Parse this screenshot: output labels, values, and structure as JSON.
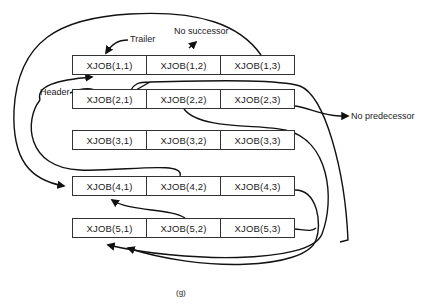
{
  "diagram": {
    "rows": [
      {
        "cells": [
          "XJOB(1,1)",
          "XJOB(1,2)",
          "XJOB(1,3)"
        ]
      },
      {
        "cells": [
          "XJOB(2,1)",
          "XJOB(2,2)",
          "XJOB(2,3)"
        ]
      },
      {
        "cells": [
          "XJOB(3,1)",
          "XJOB(3,2)",
          "XJOB(3,3)"
        ]
      },
      {
        "cells": [
          "XJOB(4,1)",
          "XJOB(4,2)",
          "XJOB(4,3)"
        ]
      },
      {
        "cells": [
          "XJOB(5,1)",
          "XJOB(5,2)",
          "XJOB(5,3)"
        ]
      }
    ],
    "labels": {
      "trailer": "Trailer",
      "no_successor": "No successor",
      "header": "Header",
      "no_predecessor": "No predecessor"
    },
    "caption": "(g)"
  }
}
